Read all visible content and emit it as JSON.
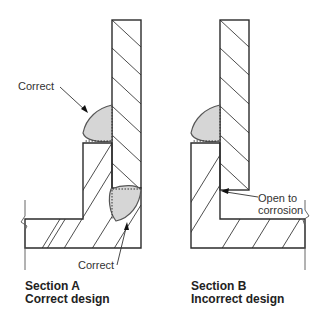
{
  "sections": [
    {
      "id": "A",
      "caption_line1": "Section A",
      "caption_line2": "Correct design",
      "weld_labels": [
        "Correct",
        "Correct"
      ]
    },
    {
      "id": "B",
      "caption_line1": "Section B",
      "caption_line2": "Incorrect design",
      "annotation_line1": "Open to",
      "annotation_line2": "corrosion"
    }
  ],
  "colors": {
    "outline": "#2b2b2b",
    "hatch": "#3a3a3a",
    "weld_fill": "#d6d6d6",
    "background": "#ffffff"
  }
}
